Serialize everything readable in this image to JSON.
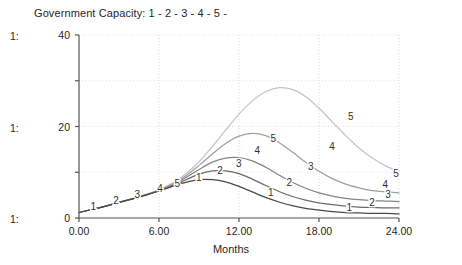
{
  "legend": {
    "title": "Government Capacity: 1 - 2 - 3 - 4 - 5 -"
  },
  "scale_labels": [
    {
      "text": "1:",
      "top": 31
    },
    {
      "text": "1:",
      "top": 123
    },
    {
      "text": "1:",
      "top": 214
    }
  ],
  "axis": {
    "xlabel": "Months",
    "y_ticks": [
      "40",
      "20",
      "0"
    ],
    "x_ticks": [
      "0.00",
      "6.00",
      "12.00",
      "18.00",
      "24.00"
    ]
  },
  "chart_data": {
    "type": "line",
    "title": "Government Capacity: 1 - 2 - 3 - 4 - 5 -",
    "xlabel": "Months",
    "ylabel": "",
    "xlim": [
      0,
      24
    ],
    "ylim": [
      0,
      40
    ],
    "x_ticks": [
      0,
      6,
      12,
      18,
      24
    ],
    "y_ticks": [
      0,
      10,
      20,
      30,
      40
    ],
    "grid": "dotted-vertical-and-horizontal",
    "legend_position": "top-left-inline",
    "series": [
      {
        "name": "1",
        "color": "#4a4a4a",
        "x": [
          0,
          1,
          2,
          3,
          4,
          5,
          6,
          7,
          8,
          9,
          10,
          11,
          12,
          13,
          14,
          15,
          16,
          17,
          18,
          19,
          20,
          21,
          22,
          23,
          24
        ],
        "values": [
          1.2,
          1.9,
          2.6,
          3.4,
          4.2,
          5.0,
          5.9,
          6.9,
          7.8,
          8.4,
          8.4,
          7.9,
          6.9,
          5.7,
          4.5,
          3.5,
          2.7,
          2.1,
          1.7,
          1.4,
          1.2,
          1.1,
          1.0,
          1.0,
          0.9
        ]
      },
      {
        "name": "2",
        "color": "#6b6b6b",
        "x": [
          0,
          1,
          2,
          3,
          4,
          5,
          6,
          7,
          8,
          9,
          10,
          11,
          12,
          13,
          14,
          15,
          16,
          17,
          18,
          19,
          20,
          21,
          22,
          23,
          24
        ],
        "values": [
          1.2,
          1.9,
          2.6,
          3.4,
          4.2,
          5.0,
          5.9,
          7.0,
          8.3,
          9.6,
          10.3,
          10.3,
          9.7,
          8.5,
          7.1,
          5.8,
          4.7,
          3.9,
          3.3,
          2.9,
          2.6,
          2.4,
          2.3,
          2.2,
          2.2
        ]
      },
      {
        "name": "3",
        "color": "#858585",
        "x": [
          0,
          1,
          2,
          3,
          4,
          5,
          6,
          7,
          8,
          9,
          10,
          11,
          12,
          13,
          14,
          15,
          16,
          17,
          18,
          19,
          20,
          21,
          22,
          23,
          24
        ],
        "values": [
          1.2,
          1.9,
          2.6,
          3.4,
          4.2,
          5.0,
          6.0,
          7.2,
          8.8,
          10.6,
          12.2,
          13.1,
          13.2,
          12.5,
          11.1,
          9.4,
          7.8,
          6.5,
          5.5,
          4.8,
          4.3,
          4.0,
          3.8,
          3.7,
          3.6
        ]
      },
      {
        "name": "4",
        "color": "#a0a0a0",
        "x": [
          0,
          1,
          2,
          3,
          4,
          5,
          6,
          7,
          8,
          9,
          10,
          11,
          12,
          13,
          14,
          15,
          16,
          17,
          18,
          19,
          20,
          21,
          22,
          23,
          24
        ],
        "values": [
          1.2,
          1.9,
          2.6,
          3.4,
          4.2,
          5.1,
          6.1,
          7.4,
          9.2,
          11.5,
          14.0,
          16.3,
          17.9,
          18.5,
          18.0,
          16.5,
          14.4,
          12.2,
          10.2,
          8.6,
          7.4,
          6.6,
          6.0,
          5.7,
          5.5
        ]
      },
      {
        "name": "5",
        "color": "#c4c4c4",
        "x": [
          0,
          1,
          2,
          3,
          4,
          5,
          6,
          7,
          8,
          9,
          10,
          11,
          12,
          13,
          14,
          15,
          16,
          17,
          18,
          19,
          20,
          21,
          22,
          23,
          24
        ],
        "values": [
          1.2,
          1.9,
          2.6,
          3.4,
          4.2,
          5.1,
          6.2,
          7.6,
          9.6,
          12.3,
          15.6,
          19.2,
          22.7,
          25.6,
          27.6,
          28.5,
          28.1,
          26.5,
          24.0,
          21.0,
          18.0,
          15.3,
          13.1,
          11.4,
          10.2
        ]
      }
    ],
    "inline_labels": [
      {
        "series": "1",
        "x": 1.3,
        "y": 2.3,
        "dx": -3,
        "dy": 0
      },
      {
        "series": "2",
        "x": 3.0,
        "y": 3.6,
        "dx": -3,
        "dy": 0
      },
      {
        "series": "3",
        "x": 4.6,
        "y": 4.9,
        "dx": -3,
        "dy": 0
      },
      {
        "series": "4",
        "x": 6.3,
        "y": 6.3,
        "dx": -3,
        "dy": 0
      },
      {
        "series": "5",
        "x": 7.6,
        "y": 7.4,
        "dx": -3,
        "dy": 0
      },
      {
        "series": "1",
        "x": 9.2,
        "y": 8.7,
        "dx": -3,
        "dy": 0
      },
      {
        "series": "2",
        "x": 10.8,
        "y": 10.1,
        "dx": -3,
        "dy": 0
      },
      {
        "series": "3",
        "x": 12.2,
        "y": 11.8,
        "dx": -3,
        "dy": 0
      },
      {
        "series": "4",
        "x": 13.6,
        "y": 14.6,
        "dx": -3,
        "dy": 0
      },
      {
        "series": "5",
        "x": 14.8,
        "y": 17.1,
        "dx": -3,
        "dy": 0
      },
      {
        "series": "1",
        "x": 14.6,
        "y": 5.3,
        "dx": -3,
        "dy": 0
      },
      {
        "series": "2",
        "x": 16.0,
        "y": 7.6,
        "dx": -3,
        "dy": 0
      },
      {
        "series": "3",
        "x": 17.6,
        "y": 11.0,
        "dx": -3,
        "dy": 0
      },
      {
        "series": "4",
        "x": 19.2,
        "y": 15.5,
        "dx": -3,
        "dy": 0
      },
      {
        "series": "5",
        "x": 20.6,
        "y": 22.0,
        "dx": -3,
        "dy": 0
      },
      {
        "series": "1",
        "x": 20.5,
        "y": 2.1,
        "dx": -3,
        "dy": 0
      },
      {
        "series": "2",
        "x": 22.2,
        "y": 3.3,
        "dx": -3,
        "dy": 0
      },
      {
        "series": "3",
        "x": 23.4,
        "y": 5.0,
        "dx": -3,
        "dy": 0
      },
      {
        "series": "4",
        "x": 23.2,
        "y": 7.2,
        "dx": -3,
        "dy": 0
      },
      {
        "series": "5",
        "x": 24.0,
        "y": 9.6,
        "dx": -3,
        "dy": 0
      }
    ]
  }
}
